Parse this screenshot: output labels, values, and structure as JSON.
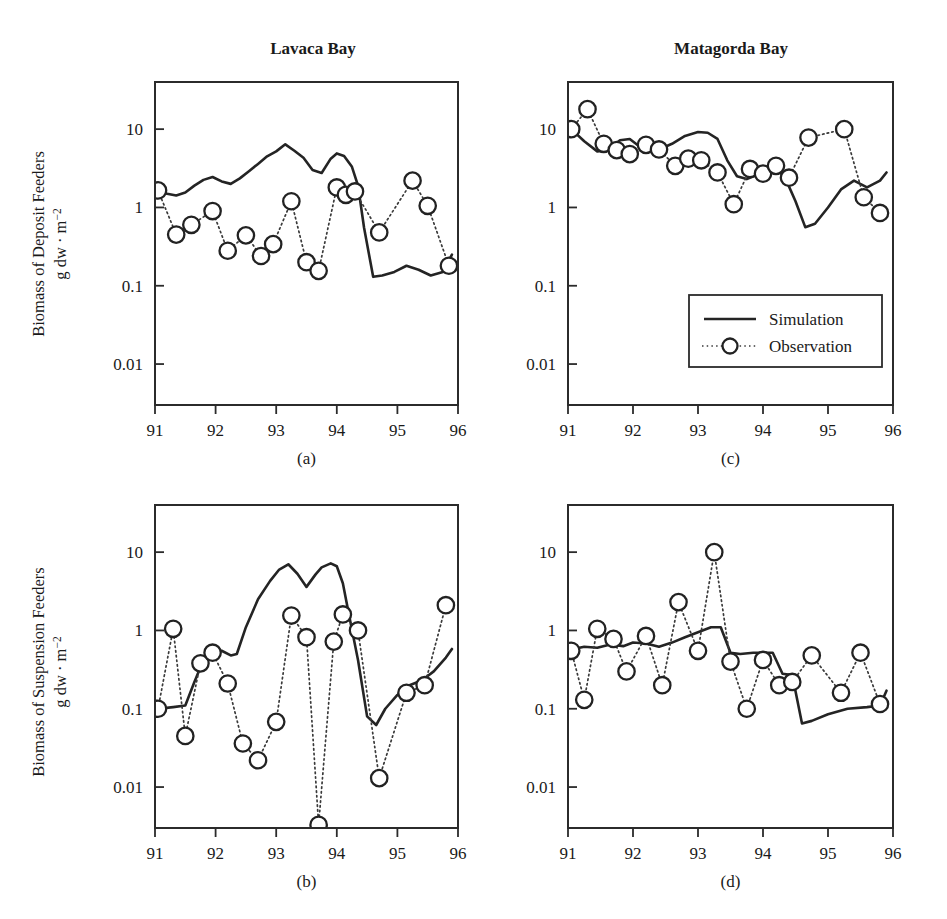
{
  "figure": {
    "background_color": "#ffffff",
    "line_color": "#242424",
    "marker_fill": "#ffffff",
    "column_titles": [
      "Lavaca Bay",
      "Matagorda Bay"
    ],
    "legend": {
      "simulation_label": "Simulation",
      "observation_label": "Observation"
    },
    "y_axis_titles": {
      "deposit_line1": "Biomass of Deposit Feeders",
      "deposit_line2": "g dw · m",
      "deposit_exp": "−2",
      "suspension_line1": "Biomass of Suspension Feeders",
      "suspension_line2": "g dw · m",
      "suspension_exp": "−2"
    }
  },
  "chart_data": [
    {
      "id": "panel-a",
      "type": "line",
      "title": "Lavaca Bay",
      "panel_label": "(a)",
      "xlabel": "",
      "ylabel": "Biomass of Deposit Feeders g dw · m−2",
      "xlim": [
        91,
        96
      ],
      "ylim": [
        0.003,
        40
      ],
      "yscale": "log",
      "ytick_values": [
        10,
        1,
        0.1,
        0.01
      ],
      "ytick_labels": [
        "10",
        "1",
        "0.1",
        "0.01"
      ],
      "xtick_values": [
        91,
        92,
        93,
        94,
        95,
        96
      ],
      "xtick_labels": [
        "91",
        "92",
        "93",
        "94",
        "95",
        "96"
      ],
      "grid": false,
      "legend_position": "none",
      "series": [
        {
          "name": "Simulation",
          "style": "solid-line",
          "x": [
            91.05,
            91.2,
            91.35,
            91.5,
            91.65,
            91.8,
            91.95,
            92.1,
            92.25,
            92.4,
            92.55,
            92.7,
            92.85,
            93.0,
            93.15,
            93.3,
            93.45,
            93.6,
            93.75,
            93.9,
            94.0,
            94.12,
            94.25,
            94.35,
            94.45,
            94.6,
            94.75,
            94.95,
            95.15,
            95.35,
            95.55,
            95.75,
            95.9
          ],
          "y": [
            1.65,
            1.5,
            1.42,
            1.55,
            1.9,
            2.25,
            2.45,
            2.15,
            2.0,
            2.35,
            2.9,
            3.6,
            4.5,
            5.2,
            6.4,
            5.3,
            4.3,
            3.0,
            2.75,
            4.2,
            4.9,
            4.55,
            3.3,
            1.9,
            0.55,
            0.13,
            0.135,
            0.15,
            0.18,
            0.16,
            0.135,
            0.15,
            0.25
          ]
        },
        {
          "name": "Observation",
          "style": "dotted-markers",
          "x": [
            91.05,
            91.35,
            91.6,
            91.95,
            92.2,
            92.5,
            92.75,
            92.95,
            93.25,
            93.5,
            93.7,
            94.0,
            94.15,
            94.3,
            94.7,
            95.25,
            95.5,
            95.85
          ],
          "y": [
            1.65,
            0.45,
            0.6,
            0.9,
            0.28,
            0.44,
            0.24,
            0.34,
            1.2,
            0.2,
            0.155,
            1.8,
            1.45,
            1.6,
            0.48,
            2.2,
            1.05,
            0.18
          ]
        }
      ]
    },
    {
      "id": "panel-b",
      "type": "line",
      "title": "Lavaca Bay",
      "panel_label": "(b)",
      "xlabel": "",
      "ylabel": "Biomass of Suspension Feeders g dw · m−2",
      "xlim": [
        91,
        96
      ],
      "ylim": [
        0.003,
        40
      ],
      "yscale": "log",
      "ytick_values": [
        10,
        1,
        0.1,
        0.01
      ],
      "ytick_labels": [
        "10",
        "1",
        "0.1",
        "0.01"
      ],
      "xtick_values": [
        91,
        92,
        93,
        94,
        95,
        96
      ],
      "xtick_labels": [
        "91",
        "92",
        "93",
        "94",
        "95",
        "96"
      ],
      "grid": false,
      "legend_position": "none",
      "series": [
        {
          "name": "Simulation",
          "style": "solid-line",
          "x": [
            91.05,
            91.3,
            91.5,
            91.65,
            91.8,
            91.95,
            92.1,
            92.25,
            92.35,
            92.5,
            92.7,
            92.9,
            93.05,
            93.2,
            93.35,
            93.5,
            93.65,
            93.75,
            93.9,
            94.0,
            94.1,
            94.2,
            94.35,
            94.5,
            94.65,
            94.8,
            95.0,
            95.2,
            95.4,
            95.6,
            95.8,
            95.9
          ],
          "y": [
            0.1,
            0.105,
            0.11,
            0.22,
            0.42,
            0.52,
            0.55,
            0.48,
            0.5,
            1.1,
            2.5,
            4.3,
            6.0,
            7.0,
            5.3,
            3.6,
            5.2,
            6.4,
            7.2,
            6.6,
            4.0,
            1.6,
            0.42,
            0.08,
            0.062,
            0.1,
            0.15,
            0.2,
            0.23,
            0.3,
            0.45,
            0.58
          ]
        },
        {
          "name": "Observation",
          "style": "dotted-markers",
          "x": [
            91.05,
            91.3,
            91.5,
            91.75,
            91.95,
            92.2,
            92.45,
            92.7,
            93.0,
            93.25,
            93.5,
            93.7,
            93.95,
            94.1,
            94.35,
            94.7,
            95.15,
            95.45,
            95.8
          ],
          "y": [
            0.1,
            1.05,
            0.045,
            0.38,
            0.52,
            0.21,
            0.036,
            0.022,
            0.068,
            1.55,
            0.82,
            0.0033,
            0.72,
            1.6,
            1.0,
            0.013,
            0.16,
            0.2,
            2.1
          ]
        }
      ]
    },
    {
      "id": "panel-c",
      "type": "line",
      "title": "Matagorda Bay",
      "panel_label": "(c)",
      "xlabel": "",
      "ylabel": "Biomass of Deposit Feeders g dw · m−2",
      "xlim": [
        91,
        96
      ],
      "ylim": [
        0.003,
        40
      ],
      "yscale": "log",
      "ytick_values": [
        10,
        1,
        0.1,
        0.01
      ],
      "ytick_labels": [
        "10",
        "1",
        "0.1",
        "0.01"
      ],
      "xtick_values": [
        91,
        92,
        93,
        94,
        95,
        96
      ],
      "xtick_labels": [
        "91",
        "92",
        "93",
        "94",
        "95",
        "96"
      ],
      "grid": false,
      "legend_position": "center-right",
      "series": [
        {
          "name": "Simulation",
          "style": "solid-line",
          "x": [
            91.05,
            91.25,
            91.45,
            91.6,
            91.8,
            91.95,
            92.1,
            92.25,
            92.4,
            92.6,
            92.8,
            93.0,
            93.15,
            93.3,
            93.45,
            93.6,
            93.75,
            93.9,
            94.05,
            94.2,
            94.35,
            94.5,
            94.65,
            94.8,
            95.0,
            95.2,
            95.4,
            95.6,
            95.8,
            95.9
          ],
          "y": [
            10.0,
            7.0,
            5.2,
            5.4,
            7.2,
            7.5,
            6.0,
            5.8,
            5.5,
            6.5,
            8.2,
            9.2,
            9.0,
            7.5,
            4.0,
            2.5,
            2.3,
            2.6,
            3.2,
            3.3,
            2.3,
            1.2,
            0.56,
            0.62,
            1.0,
            1.7,
            2.2,
            1.8,
            2.2,
            2.8
          ]
        },
        {
          "name": "Observation",
          "style": "dotted-markers",
          "x": [
            91.05,
            91.3,
            91.55,
            91.75,
            91.95,
            92.2,
            92.4,
            92.65,
            92.85,
            93.05,
            93.3,
            93.55,
            93.8,
            94.0,
            94.2,
            94.4,
            94.7,
            95.25,
            95.55,
            95.8
          ],
          "y": [
            10.0,
            18.0,
            6.5,
            5.4,
            4.8,
            6.3,
            5.5,
            3.4,
            4.2,
            4.0,
            2.8,
            1.1,
            3.1,
            2.7,
            3.4,
            2.4,
            7.8,
            10.0,
            1.35,
            0.85
          ]
        }
      ]
    },
    {
      "id": "panel-d",
      "type": "line",
      "title": "Matagorda Bay",
      "panel_label": "(d)",
      "xlabel": "",
      "ylabel": "Biomass of Suspension Feeders g dw · m−2",
      "xlim": [
        91,
        96
      ],
      "ylim": [
        0.003,
        40
      ],
      "yscale": "log",
      "ytick_values": [
        10,
        1,
        0.1,
        0.01
      ],
      "ytick_labels": [
        "10",
        "1",
        "0.1",
        "0.01"
      ],
      "xtick_values": [
        91,
        92,
        93,
        94,
        95,
        96
      ],
      "xtick_labels": [
        "91",
        "92",
        "93",
        "94",
        "95",
        "96"
      ],
      "grid": false,
      "legend_position": "none",
      "series": [
        {
          "name": "Simulation",
          "style": "solid-line",
          "x": [
            91.05,
            91.25,
            91.45,
            91.65,
            91.85,
            92.0,
            92.2,
            92.4,
            92.6,
            92.8,
            93.0,
            93.2,
            93.35,
            93.5,
            93.65,
            93.85,
            94.0,
            94.15,
            94.3,
            94.45,
            94.6,
            94.75,
            95.0,
            95.3,
            95.6,
            95.8,
            95.9
          ],
          "y": [
            0.57,
            0.62,
            0.6,
            0.66,
            0.63,
            0.7,
            0.68,
            0.62,
            0.7,
            0.82,
            0.95,
            1.1,
            1.1,
            0.52,
            0.5,
            0.52,
            0.52,
            0.52,
            0.28,
            0.27,
            0.065,
            0.07,
            0.085,
            0.1,
            0.105,
            0.11,
            0.17
          ]
        },
        {
          "name": "Observation",
          "style": "dotted-markers",
          "x": [
            91.05,
            91.25,
            91.45,
            91.7,
            91.9,
            92.2,
            92.45,
            92.7,
            93.0,
            93.25,
            93.5,
            93.75,
            94.0,
            94.25,
            94.45,
            94.75,
            95.2,
            95.5,
            95.8
          ],
          "y": [
            0.55,
            0.13,
            1.05,
            0.78,
            0.3,
            0.85,
            0.2,
            2.3,
            0.55,
            10.0,
            0.4,
            0.1,
            0.42,
            0.2,
            0.22,
            0.48,
            0.16,
            0.52,
            0.115
          ]
        }
      ]
    }
  ]
}
